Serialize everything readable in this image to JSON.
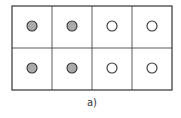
{
  "diagram": {
    "caption": "a)",
    "grid": {
      "cols": 4,
      "rows": 2,
      "x": 12,
      "y": 6,
      "width": 160,
      "height": 84
    },
    "line_color": "#333333",
    "cells": [
      {
        "row": 0,
        "col": 0,
        "filled": true
      },
      {
        "row": 0,
        "col": 1,
        "filled": true
      },
      {
        "row": 0,
        "col": 2,
        "filled": false
      },
      {
        "row": 0,
        "col": 3,
        "filled": false
      },
      {
        "row": 1,
        "col": 0,
        "filled": true
      },
      {
        "row": 1,
        "col": 1,
        "filled": true
      },
      {
        "row": 1,
        "col": 2,
        "filled": false
      },
      {
        "row": 1,
        "col": 3,
        "filled": false
      }
    ],
    "filled_color": "#a0a0a0",
    "empty_color": "#ffffff"
  }
}
